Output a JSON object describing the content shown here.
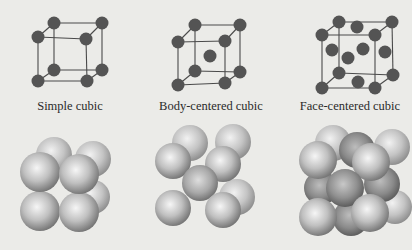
{
  "figure": {
    "background": "#ebebe8",
    "line_color": "#4a4a4a",
    "atom_color": "#545454",
    "sphere_light": "#f4f4f4",
    "sphere_mid": "#b5b5b5",
    "sphere_dark": "#6e6e6e",
    "sphere_dark_variant": "#5a5a5a"
  },
  "panels": [
    {
      "id": "simple-cubic",
      "label": "Simple cubic",
      "label_x": 70,
      "lattice": {
        "atom_r": 6.5,
        "corners": {
          "btl": [
            54,
            23
          ],
          "btr": [
            102,
            23
          ],
          "bbl": [
            54,
            70
          ],
          "bbr": [
            102,
            70
          ],
          "ftl": [
            38,
            37
          ],
          "ftr": [
            86,
            39
          ],
          "fbl": [
            38,
            81
          ],
          "fbr": [
            87,
            81
          ]
        },
        "extra_atoms": []
      },
      "spheres": {
        "r": 19,
        "items": [
          {
            "x": 93,
            "y": 197,
            "r": 17,
            "tone": "back"
          },
          {
            "x": 54,
            "y": 155,
            "r": 18,
            "tone": "back"
          },
          {
            "x": 93,
            "y": 159,
            "r": 18,
            "tone": "back"
          },
          {
            "x": 40,
            "y": 211,
            "r": 20,
            "tone": "front"
          },
          {
            "x": 79,
            "y": 212,
            "r": 20,
            "tone": "front"
          },
          {
            "x": 40,
            "y": 172,
            "r": 20,
            "tone": "front"
          },
          {
            "x": 79,
            "y": 174,
            "r": 20,
            "tone": "front"
          }
        ]
      }
    },
    {
      "id": "body-centered-cubic",
      "label": "Body-centered cubic",
      "label_x": 211,
      "lattice": {
        "atom_r": 6.5,
        "corners": {
          "btl": [
            195,
            25
          ],
          "btr": [
            240,
            25
          ],
          "bbl": [
            195,
            71
          ],
          "bbr": [
            240,
            72
          ],
          "ftl": [
            178,
            42
          ],
          "ftr": [
            225,
            41
          ],
          "fbl": [
            178,
            85
          ],
          "fbr": [
            225,
            83
          ]
        },
        "extra_atoms": [
          [
            210,
            56
          ]
        ]
      },
      "spheres": {
        "r": 19,
        "items": [
          {
            "x": 237,
            "y": 197,
            "r": 18,
            "tone": "back"
          },
          {
            "x": 190,
            "y": 143,
            "r": 18,
            "tone": "back"
          },
          {
            "x": 233,
            "y": 142,
            "r": 18,
            "tone": "back"
          },
          {
            "x": 173,
            "y": 161,
            "r": 18,
            "tone": "front"
          },
          {
            "x": 223,
            "y": 164,
            "r": 18,
            "tone": "front"
          },
          {
            "x": 200,
            "y": 183,
            "r": 18,
            "tone": "center"
          },
          {
            "x": 173,
            "y": 208,
            "r": 18,
            "tone": "front"
          },
          {
            "x": 223,
            "y": 210,
            "r": 18,
            "tone": "front"
          }
        ]
      }
    },
    {
      "id": "face-centered-cubic",
      "label": "Face-centered cubic",
      "label_x": 350,
      "lattice": {
        "atom_r": 6.5,
        "corners": {
          "btl": [
            339,
            22
          ],
          "btr": [
            392,
            22
          ],
          "bbl": [
            339,
            73
          ],
          "bbr": [
            393,
            75
          ],
          "ftl": [
            322,
            35
          ],
          "ftr": [
            375,
            35
          ],
          "fbl": [
            322,
            88
          ],
          "fbr": [
            375,
            88
          ]
        },
        "extra_atoms": [
          [
            357,
            27
          ],
          [
            332,
            50
          ],
          [
            363,
            49
          ],
          [
            385,
            52
          ],
          [
            348,
            58
          ],
          [
            358,
            82
          ]
        ]
      },
      "spheres": {
        "r": 19,
        "items": [
          {
            "x": 333,
            "y": 143,
            "r": 18,
            "tone": "back"
          },
          {
            "x": 392,
            "y": 147,
            "r": 18,
            "tone": "back"
          },
          {
            "x": 395,
            "y": 207,
            "r": 17,
            "tone": "back"
          },
          {
            "x": 357,
            "y": 150,
            "r": 18,
            "tone": "dark"
          },
          {
            "x": 382,
            "y": 184,
            "r": 18,
            "tone": "dark"
          },
          {
            "x": 321,
            "y": 188,
            "r": 17,
            "tone": "dark"
          },
          {
            "x": 351,
            "y": 218,
            "r": 18,
            "tone": "dark"
          },
          {
            "x": 318,
            "y": 160,
            "r": 19,
            "tone": "front"
          },
          {
            "x": 371,
            "y": 162,
            "r": 19,
            "tone": "front"
          },
          {
            "x": 345,
            "y": 188,
            "r": 19,
            "tone": "darkfront"
          },
          {
            "x": 318,
            "y": 217,
            "r": 19,
            "tone": "front"
          },
          {
            "x": 370,
            "y": 213,
            "r": 19,
            "tone": "front"
          }
        ]
      }
    }
  ]
}
